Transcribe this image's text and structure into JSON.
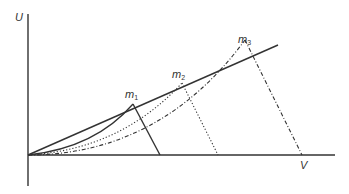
{
  "diagram": {
    "axes": {
      "y_label": "U",
      "x_label": "V"
    },
    "line": {
      "label": "",
      "style": "solid"
    },
    "points": [
      {
        "label": "m",
        "subscript": "1",
        "curve_style": "solid"
      },
      {
        "label": "m",
        "subscript": "2",
        "curve_style": "dotted"
      },
      {
        "label": "m",
        "subscript": "3",
        "curve_style": "dash-dot"
      }
    ],
    "colors": {
      "stroke": "#333333",
      "background": "#ffffff"
    }
  }
}
